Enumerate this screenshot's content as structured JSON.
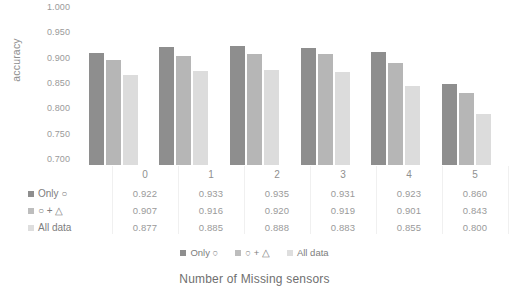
{
  "chart_data": {
    "type": "bar",
    "title": "",
    "xlabel": "Number of Missing sensors",
    "ylabel": "accuracy",
    "categories": [
      "0",
      "1",
      "2",
      "3",
      "4",
      "5"
    ],
    "ylim": [
      0.7,
      1.0
    ],
    "yticks": [
      "1.000",
      "0.950",
      "0.900",
      "0.850",
      "0.800",
      "0.750",
      "0.700"
    ],
    "ytick_values": [
      1.0,
      0.95,
      0.9,
      0.85,
      0.8,
      0.75,
      0.7
    ],
    "grid": false,
    "legend_position": "bottom",
    "series": [
      {
        "name": "Only ○",
        "color": "#8e8e8e",
        "values": [
          0.922,
          0.933,
          0.935,
          0.931,
          0.923,
          0.86
        ]
      },
      {
        "name": "○ + △",
        "color": "#b6b6b6",
        "values": [
          0.907,
          0.916,
          0.92,
          0.919,
          0.901,
          0.843
        ]
      },
      {
        "name": "All data",
        "color": "#dcdcdc",
        "values": [
          0.877,
          0.885,
          0.888,
          0.883,
          0.855,
          0.8
        ]
      }
    ]
  },
  "data_table": {
    "category_header_row": [
      "0",
      "1",
      "2",
      "3",
      "4",
      "5"
    ],
    "rows": [
      {
        "label": "Only ○",
        "swatch": "s0",
        "values": [
          "0.922",
          "0.933",
          "0.935",
          "0.931",
          "0.923",
          "0.860"
        ]
      },
      {
        "label": "○ + △",
        "swatch": "s1",
        "values": [
          "0.907",
          "0.916",
          "0.920",
          "0.919",
          "0.901",
          "0.843"
        ]
      },
      {
        "label": "All data",
        "swatch": "s2",
        "values": [
          "0.877",
          "0.885",
          "0.888",
          "0.883",
          "0.855",
          "0.800"
        ]
      }
    ]
  },
  "legend": {
    "items": [
      {
        "label": "Only ○",
        "swatch": "s0"
      },
      {
        "label": "○ + △",
        "swatch": "s1"
      },
      {
        "label": "All data",
        "swatch": "s2"
      }
    ]
  }
}
